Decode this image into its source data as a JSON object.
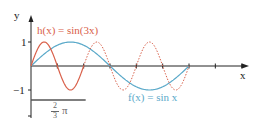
{
  "chart_data": {
    "type": "line",
    "title": "",
    "xlabel": "x",
    "ylabel": "y",
    "y_ticks": [
      "1",
      "-1"
    ],
    "ylim": [
      -1.2,
      1.6
    ],
    "xlim": [
      0,
      2.86
    ],
    "x_unit": "pi",
    "scale_bar": {
      "label_num": "2",
      "label_den": "3",
      "label_sym": "π",
      "length_pi": 0.6667
    },
    "grid": false,
    "series": [
      {
        "name": "h(x) = sin(3x)",
        "function": "sin(3x)",
        "color": "#d9604a",
        "solid_range_pi": [
          0,
          0.6667
        ],
        "dashed_range_pi": [
          0.6667,
          2.0
        ]
      },
      {
        "name": "f(x) = sin x",
        "function": "sin(x)",
        "color": "#5aa9c9",
        "solid_range_pi": [
          0,
          2.0
        ]
      }
    ]
  },
  "labels": {
    "y_axis": "y",
    "x_axis": "x",
    "tick_1": "1",
    "tick_m1": "−1",
    "h_label": "h(x) = sin(3x)",
    "f_label": "f(x) = sin x",
    "frac_num": "2",
    "frac_den": "3",
    "pi": "π"
  },
  "colors": {
    "axis": "#222222",
    "h": "#d9604a",
    "f": "#5aa9c9",
    "scale": "#555555"
  }
}
